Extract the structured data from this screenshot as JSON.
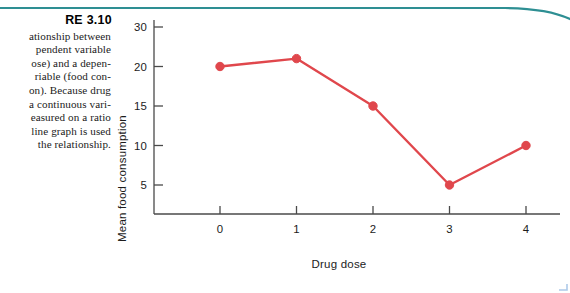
{
  "figure": {
    "title": "RE 3.10",
    "caption_lines": [
      "ationship between",
      "pendent variable",
      "ose) and a depen-",
      "riable (food con-",
      "on). Because drug",
      "a continuous vari-",
      "easured on a ratio",
      "line graph is used",
      "the relationship."
    ]
  },
  "decoration": {
    "rule_color": "#2e8f93",
    "corner_mark_color": "#6c9fd8"
  },
  "chart_data": {
    "type": "line",
    "title": "",
    "xlabel": "Drug dose",
    "ylabel": "Mean food consumption",
    "x": [
      0,
      1,
      2,
      3,
      4
    ],
    "categories": [
      "0",
      "1",
      "2",
      "3",
      "4"
    ],
    "values": [
      20,
      22,
      15,
      5,
      10
    ],
    "series": [
      {
        "name": "Mean food consumption",
        "values": [
          20,
          22,
          15,
          5,
          10
        ]
      }
    ],
    "xtick_labels": [
      "0",
      "1",
      "2",
      "3",
      "4"
    ],
    "ytick_labels": [
      "30",
      "20",
      "15",
      "10",
      "5"
    ],
    "ytick_values": [
      30,
      20,
      15,
      10,
      5
    ],
    "ylim": [
      0,
      30
    ],
    "xlim": [
      -0.55,
      4.55
    ],
    "grid": false,
    "legend": "none",
    "line_color": "#e0474c",
    "marker_color": "#e0474c",
    "axis_color": "#4a4a4a"
  }
}
